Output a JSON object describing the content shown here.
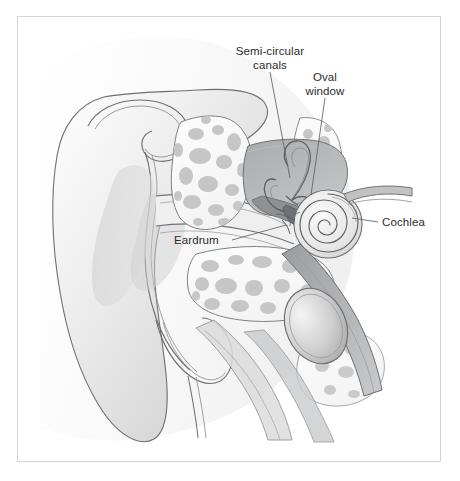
{
  "figure": {
    "background_color": "#ffffff",
    "frame_color": "#d4d4d6"
  },
  "labels": [
    {
      "id": "semi-circular-canals",
      "line1": "Semi-circular",
      "line2": "canals",
      "text_x": 222,
      "text_y": 44,
      "leader": {
        "x1": 270,
        "y1": 72,
        "x2": 290,
        "y2": 178
      }
    },
    {
      "id": "oval-window",
      "line1": "Oval",
      "line2": "window",
      "text_x": 301,
      "text_y": 70,
      "leader": {
        "x1": 325,
        "y1": 98,
        "x2": 311,
        "y2": 195
      }
    },
    {
      "id": "eardrum",
      "line1": "Eardrum",
      "line2": "",
      "text_x": 174,
      "text_y": 235,
      "leader": {
        "x1": 232,
        "y1": 240,
        "x2": 286,
        "y2": 225
      }
    },
    {
      "id": "cochlea",
      "line1": "Cochlea",
      "line2": "",
      "text_x": 382,
      "text_y": 217,
      "leader": {
        "x1": 378,
        "y1": 222,
        "x2": 352,
        "y2": 218
      }
    }
  ],
  "colors": {
    "outline": "#5f6164",
    "outline_light": "#8a8c8f",
    "skin_light": "#f2f2f2",
    "skin_mid": "#d9d9d9",
    "skin_dark": "#bdbdbd",
    "cartilage": "#cccccc",
    "bone_fill": "#fbfbfb",
    "bone_spot": "#c8c8c8",
    "cavity_dark": "#9fa1a3",
    "cavity_mid": "#b5b7b9",
    "canal_fill": "#efefef",
    "cochlea_fill": "#e9e9e9"
  },
  "structures": [
    "pinna",
    "ear-canal",
    "eardrum",
    "ossicles",
    "semi-circular-canals",
    "oval-window",
    "cochlea",
    "eustachian-tube",
    "temporal-bone"
  ]
}
